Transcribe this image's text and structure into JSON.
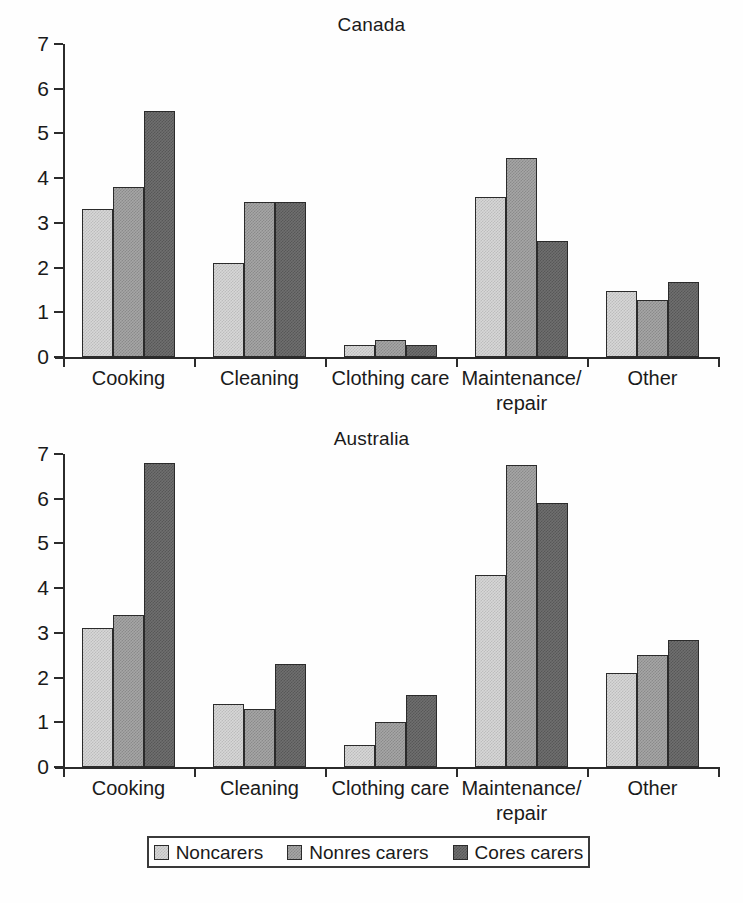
{
  "figure": {
    "legend": {
      "items": [
        {
          "label": "Noncarers",
          "color": "#d7d7d7"
        },
        {
          "label": "Nonres carers",
          "color": "#a6a6a6"
        },
        {
          "label": "Cores carers",
          "color": "#6f6f6f"
        }
      ]
    },
    "caption": ""
  },
  "chart_data": [
    {
      "type": "bar",
      "title": "Canada",
      "xlabel": "",
      "ylabel": "",
      "ylim": [
        0,
        7
      ],
      "yticks": [
        0,
        1,
        2,
        3,
        4,
        5,
        6,
        7
      ],
      "ytick_labels": [
        "0",
        "1",
        "2",
        "3",
        "4",
        "5",
        "6",
        "7"
      ],
      "grid": false,
      "legend_position": "bottom",
      "categories": [
        "Cooking",
        "Cleaning",
        "Clothing care",
        "Maintenance/\nrepair",
        "Other"
      ],
      "series": [
        {
          "name": "Noncarers",
          "values": [
            3.3,
            2.1,
            0.27,
            3.57,
            1.47
          ]
        },
        {
          "name": "Nonres carers",
          "values": [
            3.8,
            3.47,
            0.38,
            4.45,
            1.27
          ]
        },
        {
          "name": "Cores carers",
          "values": [
            5.5,
            3.47,
            0.27,
            2.6,
            1.67
          ]
        }
      ]
    },
    {
      "type": "bar",
      "title": "Australia",
      "xlabel": "",
      "ylabel": "",
      "ylim": [
        0,
        7
      ],
      "yticks": [
        0,
        1,
        2,
        3,
        4,
        5,
        6,
        7
      ],
      "ytick_labels": [
        "0",
        "1",
        "2",
        "3",
        "4",
        "5",
        "6",
        "7"
      ],
      "grid": false,
      "legend_position": "bottom",
      "categories": [
        "Cooking",
        "Cleaning",
        "Clothing care",
        "Maintenance/\nrepair",
        "Other"
      ],
      "series": [
        {
          "name": "Noncarers",
          "values": [
            3.1,
            1.4,
            0.5,
            4.3,
            2.1
          ]
        },
        {
          "name": "Nonres carers",
          "values": [
            3.4,
            1.3,
            1.0,
            6.75,
            2.5
          ]
        },
        {
          "name": "Cores carers",
          "values": [
            6.8,
            2.3,
            1.6,
            5.9,
            2.85
          ]
        }
      ]
    }
  ]
}
